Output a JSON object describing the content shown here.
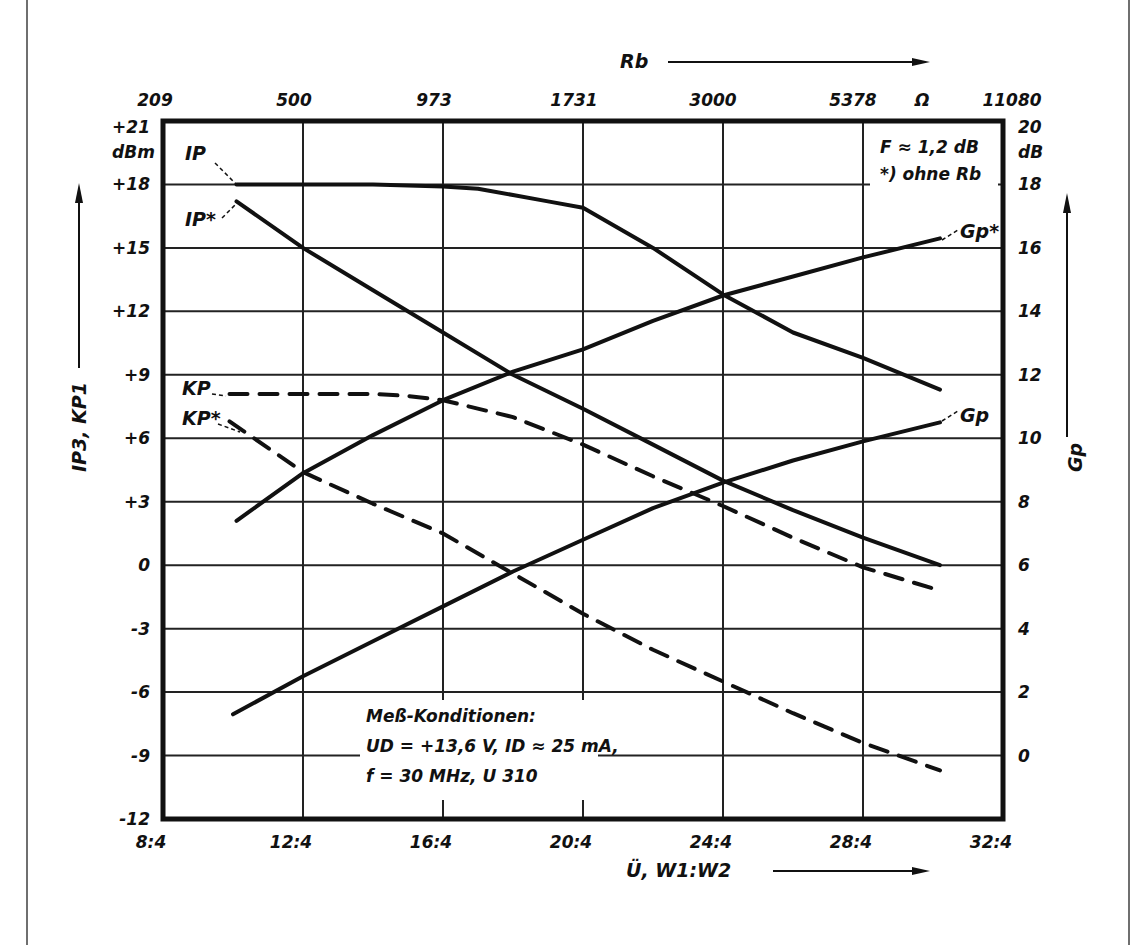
{
  "chart_data": {
    "type": "line",
    "title": "",
    "xlabel": "Ü, W1:W2",
    "x_tick_labels": [
      "8:4",
      "12:4",
      "16:4",
      "20:4",
      "24:4",
      "28:4",
      "32:4"
    ],
    "x_numeric": [
      8,
      12,
      16,
      20,
      24,
      28,
      32
    ],
    "xlim": [
      8,
      32
    ],
    "top_axis": {
      "label": "Rb",
      "unit": "Ω",
      "tick_labels": [
        "209",
        "500",
        "973",
        "1731",
        "3000",
        "5378",
        "11080"
      ]
    },
    "ylabel_left": "IP3, KP1",
    "ylabel_left_unit": "dBm",
    "y_left_ticks": [
      "+21",
      "+18",
      "+15",
      "+12",
      "+9",
      "+6",
      "+3",
      "0",
      "-3",
      "-6",
      "-9",
      "-12"
    ],
    "ylim_left": [
      -12,
      21
    ],
    "ylabel_right": "Gp",
    "ylabel_right_unit": "dB",
    "y_right_ticks": [
      "20",
      "18",
      "16",
      "14",
      "12",
      "10",
      "8",
      "6",
      "4",
      "2",
      "0"
    ],
    "ylim_right": [
      -2,
      20
    ],
    "grid": true,
    "legend_position": "inline labels",
    "annotations": {
      "noise_figure": "F ≈ 1,2 dB",
      "footnote": "*) ohne Rb",
      "conditions_title": "Meß-Konditionen:",
      "conditions_line1": "UD = +13,6 V,  ID ≈ 25 mA,",
      "conditions_line2": "f = 30 MHz,  U 310"
    },
    "series": [
      {
        "name": "IP",
        "axis": "left",
        "style": "solid",
        "x": [
          10.1,
          12,
          14,
          16,
          17,
          18,
          19,
          20,
          22,
          24,
          26,
          28,
          30.2
        ],
        "values": [
          18.0,
          18.0,
          18.0,
          17.9,
          17.8,
          17.5,
          17.2,
          16.9,
          15.0,
          12.8,
          11.0,
          9.8,
          8.3
        ]
      },
      {
        "name": "IP*",
        "axis": "left",
        "style": "solid",
        "x": [
          10.1,
          12,
          14,
          16,
          18,
          20,
          22,
          24,
          26,
          28,
          30.2
        ],
        "values": [
          17.2,
          15.0,
          13.0,
          11.0,
          9.0,
          7.4,
          5.7,
          4.0,
          2.6,
          1.3,
          0.0
        ]
      },
      {
        "name": "KP",
        "axis": "left",
        "style": "dashed",
        "x": [
          9.9,
          12,
          14,
          15,
          16,
          18,
          20,
          22,
          24,
          26,
          28,
          30.2
        ],
        "values": [
          8.1,
          8.1,
          8.1,
          8.0,
          7.8,
          7.0,
          5.7,
          4.2,
          2.8,
          1.3,
          -0.1,
          -1.2
        ]
      },
      {
        "name": "KP*",
        "axis": "left",
        "style": "dashed",
        "x": [
          9.9,
          12,
          14,
          16,
          18,
          20,
          22,
          24,
          26,
          28,
          30.2
        ],
        "values": [
          6.8,
          4.4,
          2.9,
          1.5,
          -0.4,
          -2.3,
          -4.0,
          -5.5,
          -7.0,
          -8.4,
          -9.7
        ]
      },
      {
        "name": "Gp*",
        "axis": "right",
        "style": "solid",
        "x": [
          10.1,
          12,
          14,
          16,
          18,
          20,
          22,
          24,
          26,
          28,
          30.2
        ],
        "values": [
          7.4,
          8.9,
          10.1,
          11.2,
          12.1,
          12.8,
          13.7,
          14.5,
          15.1,
          15.7,
          16.3
        ]
      },
      {
        "name": "Gp",
        "axis": "right",
        "style": "solid",
        "x": [
          10.0,
          12,
          14,
          16,
          18,
          20,
          22,
          24,
          26,
          28,
          30.2
        ],
        "values": [
          1.3,
          2.5,
          3.6,
          4.7,
          5.8,
          6.8,
          7.8,
          8.6,
          9.3,
          9.9,
          10.5
        ]
      }
    ]
  }
}
